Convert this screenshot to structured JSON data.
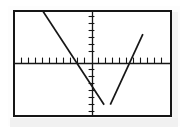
{
  "screen": {
    "device": "graphing-calculator-screen",
    "frame_color": "#161616",
    "background_color": "#ffffff",
    "page_background_color": "#ffffff",
    "shadow_color": "#f1f1f1"
  },
  "chart_data": {
    "type": "line",
    "title": "",
    "subtitle": "",
    "xlabel": "",
    "ylabel": "",
    "grid": false,
    "legend": "none",
    "axes": {
      "style": "calculator-crosshair",
      "x_axis_visible": true,
      "y_axis_visible": true,
      "axis_color": "#161616",
      "tick_marks": true,
      "tick_spacing_units": 1,
      "tick_labels_shown": false,
      "xlim": [
        -10,
        10
      ],
      "ylim": [
        -7,
        7
      ],
      "origin_x_units": 0,
      "origin_y_units": 0
    },
    "series": [
      {
        "name": "descending-line",
        "type": "line",
        "color": "#161616",
        "slope": -1.6,
        "y_intercept": -3.1,
        "x_intercept": -2.0,
        "points": [
          {
            "x": -9.0,
            "y": 11.3
          },
          {
            "x": -2.0,
            "y": 0.0
          },
          {
            "x": 1.5,
            "y": -5.6
          }
        ],
        "pixel_points": [
          {
            "x": 32,
            "y": 12
          },
          {
            "x": 72,
            "y": 60
          },
          {
            "x": 110,
            "y": 112
          }
        ]
      },
      {
        "name": "ascending-line",
        "type": "line",
        "color": "#161616",
        "slope": 1.7,
        "y_intercept": -6.4,
        "x_intercept": 3.8,
        "points": [
          {
            "x": 2.3,
            "y": -5.6
          },
          {
            "x": 3.8,
            "y": 0.0
          },
          {
            "x": 6.5,
            "y": 4.0
          }
        ],
        "pixel_points": [
          {
            "x": 116,
            "y": 112
          },
          {
            "x": 147,
            "y": 60
          },
          {
            "x": 168,
            "y": 42
          }
        ]
      }
    ],
    "annotations": [
      {
        "name": "v-vertex-intersection",
        "description": "Two lines meet below the x-axis forming a V shape",
        "x": 1.9,
        "y": -5.7,
        "pixel_x": 113,
        "pixel_y": 113
      }
    ]
  }
}
